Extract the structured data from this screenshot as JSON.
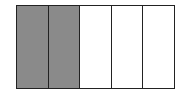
{
  "diagram": {
    "type": "fraction-bar",
    "total_parts": 5,
    "shaded_parts": 2,
    "parts": [
      {
        "shaded": true
      },
      {
        "shaded": true
      },
      {
        "shaded": false
      },
      {
        "shaded": false
      },
      {
        "shaded": false
      }
    ],
    "colors": {
      "shaded": "#8a8a8a",
      "empty": "#ffffff",
      "border": "#222222"
    }
  }
}
